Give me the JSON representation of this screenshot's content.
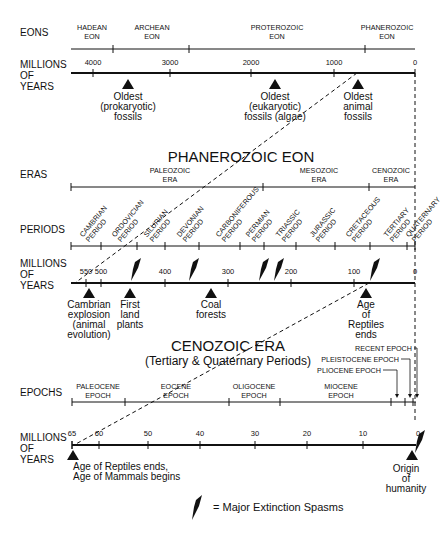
{
  "row_labels": {
    "eons": "EONS",
    "my1": [
      "MILLIONS",
      "OF",
      "YEARS"
    ],
    "eras": "ERAS",
    "periods": "PERIODS",
    "my2": [
      "MILLIONS",
      "OF",
      "YEARS"
    ],
    "epochs": "EPOCHS",
    "my3": [
      "MILLIONS",
      "OF",
      "YEARS"
    ]
  },
  "section_titles": {
    "phanerozoic": "PHANEROZOIC EON",
    "cenozoic": "CENOZOIC ERA",
    "cenozoic_sub": "(Tertiary & Quaternary Periods)"
  },
  "eons": [
    {
      "lines": [
        "HADEAN",
        "EON"
      ],
      "x": 92
    },
    {
      "lines": [
        "ARCHEAN",
        "EON"
      ],
      "x": 152
    },
    {
      "lines": [
        "PROTEROZOIC",
        "EON"
      ],
      "x": 277
    },
    {
      "lines": [
        "PHANEROZOIC",
        "EON"
      ],
      "x": 387
    }
  ],
  "eon_ticks": [
    113,
    189,
    365
  ],
  "eon_axis_labels": [
    {
      "label": "4000",
      "x": 93
    },
    {
      "label": "3000",
      "x": 170
    },
    {
      "label": "2000",
      "x": 251
    },
    {
      "label": "1000",
      "x": 334
    },
    {
      "label": "0",
      "x": 415
    }
  ],
  "eon_events": [
    {
      "lines": [
        "Oldest",
        "(prokaryotic)",
        "fossils"
      ],
      "x": 128
    },
    {
      "lines": [
        "Oldest",
        "(eukaryotic)",
        "fossils (algae)"
      ],
      "x": 275
    },
    {
      "lines": [
        "Oldest",
        "animal",
        "fossils"
      ],
      "x": 358
    }
  ],
  "eras": [
    {
      "lines": [
        "PALEOZOIC",
        "ERA"
      ],
      "x": 170
    },
    {
      "lines": [
        "MESOZOIC",
        "ERA"
      ],
      "x": 319
    },
    {
      "lines": [
        "CENOZOIC",
        "ERA"
      ],
      "x": 391
    }
  ],
  "era_ticks": [
    263,
    369
  ],
  "periods": [
    {
      "lines": [
        "CAMBRIAN",
        "PERIOD"
      ],
      "x": 86
    },
    {
      "lines": [
        "ORDOVICIAN",
        "PERIOD"
      ],
      "x": 118
    },
    {
      "lines": [
        "SILURIAN",
        "PERIOD"
      ],
      "x": 150
    },
    {
      "lines": [
        "DEVONIAN",
        "PERIOD"
      ],
      "x": 183
    },
    {
      "lines": [
        "CARBONIFEROUS",
        "PERIOD"
      ],
      "x": 222
    },
    {
      "lines": [
        "PERMIAN",
        "PERIOD"
      ],
      "x": 252
    },
    {
      "lines": [
        "TRIASSIC",
        "PERIOD"
      ],
      "x": 282
    },
    {
      "lines": [
        "JURASSIC",
        "PERIOD"
      ],
      "x": 316
    },
    {
      "lines": [
        "CRETACEOUS",
        "PERIOD"
      ],
      "x": 352
    },
    {
      "lines": [
        "TERTIARY",
        "PERIOD"
      ],
      "x": 390
    },
    {
      "lines": [
        "QUATERNARY",
        "PERIOD"
      ],
      "x": 412
    }
  ],
  "period_ticks": [
    71,
    101,
    137,
    165,
    199,
    240,
    264,
    296,
    335,
    370,
    407,
    415
  ],
  "period_axis_labels": [
    {
      "label": "550",
      "x": 86
    },
    {
      "label": "500",
      "x": 101
    },
    {
      "label": "400",
      "x": 165
    },
    {
      "label": "300",
      "x": 228
    },
    {
      "label": "200",
      "x": 291
    },
    {
      "label": "100",
      "x": 354
    },
    {
      "label": "0",
      "x": 415
    }
  ],
  "period_axis_ticks": [
    86,
    101,
    165,
    228,
    291,
    354
  ],
  "extinction_marks": [
    {
      "x": 133,
      "y": 262
    },
    {
      "x": 191,
      "y": 262
    },
    {
      "x": 261,
      "y": 262
    },
    {
      "x": 276,
      "y": 262
    },
    {
      "x": 372,
      "y": 262
    },
    {
      "x": 417,
      "y": 434
    }
  ],
  "period_events": [
    {
      "lines": [
        "Cambrian",
        "explosion",
        "(animal",
        "evolution)"
      ],
      "x": 89
    },
    {
      "lines": [
        "First",
        "land",
        "plants"
      ],
      "x": 130
    },
    {
      "lines": [
        "Coal",
        "forests"
      ],
      "x": 211
    },
    {
      "lines": [
        "Age",
        "of",
        "Reptiles",
        "ends"
      ],
      "x": 366
    }
  ],
  "epochs": [
    {
      "lines": [
        "PALEOCENE",
        "EPOCH"
      ],
      "x": 98
    },
    {
      "lines": [
        "EOCENE",
        "EPOCH"
      ],
      "x": 176
    },
    {
      "lines": [
        "OLIGOCENE",
        "EPOCH"
      ],
      "x": 254
    },
    {
      "lines": [
        "MIOCENE",
        "EPOCH"
      ],
      "x": 341
    }
  ],
  "epoch_ticks": [
    125,
    229,
    280,
    391,
    405,
    413
  ],
  "epoch_callouts": [
    {
      "label": "RECENT EPOCH",
      "x": 418,
      "y": 351,
      "arrow_x": 417
    },
    {
      "label": "PLEISTOCENE EPOCH",
      "x": 405,
      "y": 362,
      "arrow_x": 410
    },
    {
      "label": "PLIOCENE EPOCH",
      "x": 387,
      "y": 373,
      "arrow_x": 397
    }
  ],
  "epoch_axis_labels": [
    {
      "label": "65",
      "x": 72
    },
    {
      "label": "60",
      "x": 99
    },
    {
      "label": "50",
      "x": 148
    },
    {
      "label": "40",
      "x": 200
    },
    {
      "label": "30",
      "x": 255
    },
    {
      "label": "20",
      "x": 307
    },
    {
      "label": "10",
      "x": 363
    },
    {
      "label": "0",
      "x": 418
    }
  ],
  "epoch_axis_ticks": [
    72,
    99,
    148,
    200,
    255,
    307,
    363
  ],
  "epoch_events": [
    {
      "lines": [
        "Age of Reptiles ends,",
        "Age of Mammals begins"
      ],
      "x": 73,
      "anchor": "start"
    },
    {
      "lines": [
        "Origin",
        "of",
        "humanity"
      ],
      "x": 406,
      "anchor": "middle"
    }
  ],
  "legend": {
    "label": "= Major Extinction Spasms"
  },
  "colors": {
    "ink": "#111111",
    "background": "#ffffff"
  }
}
